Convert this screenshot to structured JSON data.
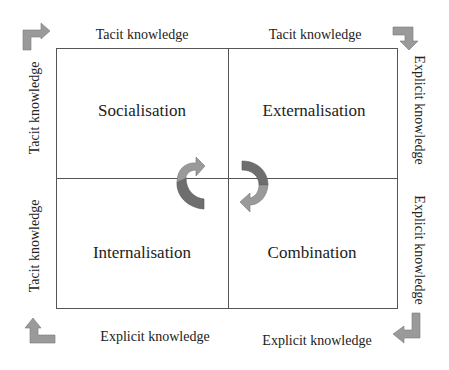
{
  "diagram": {
    "quadrants": [
      {
        "position": "top-left",
        "label": "Socialisation"
      },
      {
        "position": "top-right",
        "label": "Externalisation"
      },
      {
        "position": "bottom-left",
        "label": "Internalisation"
      },
      {
        "position": "bottom-right",
        "label": "Combination"
      }
    ],
    "top_labels": {
      "left": "Tacit knowledge",
      "right": "Tacit knowledge"
    },
    "bottom_labels": {
      "left": "Explicit knowledge",
      "right": "Explicit knowledge"
    },
    "left_labels": {
      "top": "Tacit knowledge",
      "bottom": "Tacit knowledge"
    },
    "right_labels": {
      "top": "Explicit knowledge",
      "bottom": "Explicit knowledge"
    },
    "icons": {
      "corner_top_left": "bent-arrow-right-icon",
      "corner_top_right": "bent-arrow-down-icon",
      "corner_bottom_left": "bent-arrow-up-icon",
      "corner_bottom_right": "bent-arrow-left-icon",
      "center_left": "curved-cycle-arrow-icon",
      "center_right": "curved-cycle-arrow-icon"
    },
    "colors": {
      "arrow_light": "#9a9a9a",
      "arrow_dark": "#6e6e6e",
      "line": "#555555",
      "text": "#222222"
    }
  }
}
